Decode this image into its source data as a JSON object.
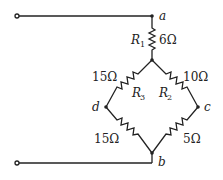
{
  "nodes": {
    "a": "a",
    "b": "b",
    "c": "c",
    "d": "d"
  },
  "resistors": {
    "r1": {
      "name": "R",
      "sub": "1",
      "value": "6Ω"
    },
    "r2": {
      "name": "R",
      "sub": "2",
      "value": "10Ω"
    },
    "r3": {
      "name": "R",
      "sub": "3",
      "value": "15Ω"
    },
    "r_db": {
      "value": "15Ω"
    },
    "r_cb": {
      "value": "5Ω"
    }
  },
  "colors": {
    "wire": "#222222",
    "background": "#ffffff"
  }
}
